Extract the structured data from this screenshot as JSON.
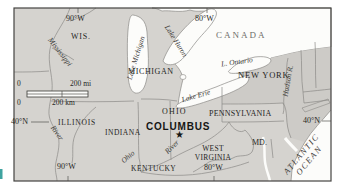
{
  "labels": {
    "canada": "CANADA",
    "wisconsin": "WIS.",
    "michigan": "MICHIGAN",
    "illinois": "ILLINOIS",
    "indiana": "INDIANA",
    "ohio": "OHIO",
    "kentucky": "KENTUCKY",
    "west_virginia_line1": "WEST",
    "west_virginia_line2": "VIRGINIA",
    "pennsylvania": "PENNSYLVANIA",
    "new_york": "NEW YORK",
    "maryland": "MD.",
    "columbus": "COLUMBUS",
    "columbus_star": "★"
  },
  "water": {
    "lake_michigan": "Lake Michigan",
    "lake_huron": "Lake Huron",
    "lake_erie": "Lake Erie",
    "lake_ontario": "L. Ontario",
    "mississippi": "Mississippi",
    "mississippi_river": "River",
    "ohio_river_name": "Ohio",
    "ohio_river_word": "River",
    "hudson": "Hudson R.",
    "atlantic_line1": "ATLANTIC",
    "atlantic_line2": "OCEAN"
  },
  "graticule": {
    "lon_90w_top": "90°W",
    "lon_80w_top": "80°W",
    "lon_90w_bottom": "90°W",
    "lon_80w_bottom": "80°W",
    "lat_40n_left": "40°N",
    "lat_40n_right": "40°N"
  },
  "scale_bar": {
    "mi_zero": "0",
    "mi_label": "200 mi",
    "km_zero": "0",
    "km_label": "200 km"
  },
  "colors": {
    "land": "#d5d3cf",
    "land_northeast": "#cdcbc7",
    "water": "#fcfcfa",
    "border_line": "#8b8a86",
    "frame": "#454441",
    "label_text": "#262624",
    "water_label_text": "#3c3b38",
    "artifact_teal": "#3fa3a0"
  }
}
